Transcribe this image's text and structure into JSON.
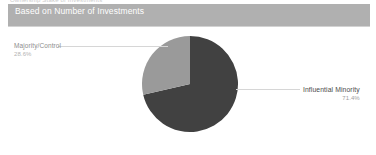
{
  "top_clip_text": "Ownership Stake of Investments",
  "header": {
    "title": "Based on Number of Investments",
    "background_color": "#b0b0b0",
    "text_color": "#ffffff"
  },
  "chart_data": {
    "type": "pie",
    "title": "Based on Number of Investments",
    "categories": [
      "Influential Minority",
      "Majority/Control"
    ],
    "values": [
      71.4,
      28.6
    ],
    "value_labels": [
      "71.4%",
      "28.6%"
    ],
    "unit": "%",
    "colors": [
      "#414141",
      "#9a9a9a"
    ],
    "legend": "none",
    "labels_position": "callout",
    "start_angle_deg": 0,
    "direction": "clockwise",
    "slices": [
      {
        "name": "Influential Minority",
        "value": 71.4,
        "value_label": "71.4%",
        "color": "#414141",
        "callout_side": "right"
      },
      {
        "name": "Majority/Control",
        "value": 28.6,
        "value_label": "28.6%",
        "color": "#9a9a9a",
        "callout_side": "left"
      }
    ]
  }
}
